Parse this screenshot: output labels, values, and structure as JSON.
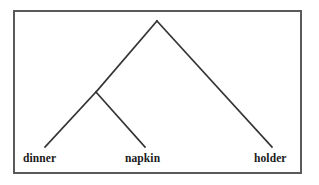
{
  "figure": {
    "kind": "syntax-tree",
    "bracketing": "[[dinner napkin] holder]",
    "border_color": "#5a5a5a",
    "line_color": "#333333",
    "background_color": "#ffffff",
    "text_color": "#1a1a1a"
  },
  "tree": {
    "root": {
      "name": "root-node",
      "x": 157,
      "y": 21
    },
    "internal": [
      {
        "name": "inner-node",
        "x": 96,
        "y": 92
      }
    ],
    "leaves": [
      {
        "name": "leaf-dinner",
        "label": "dinner",
        "x": 45,
        "y": 147
      },
      {
        "name": "leaf-napkin",
        "label": "napkin",
        "x": 145,
        "y": 147
      },
      {
        "name": "leaf-holder",
        "label": "holder",
        "x": 272,
        "y": 147
      }
    ],
    "branches": [
      {
        "name": "branch-root-to-inner",
        "x1": 157,
        "y1": 21,
        "x2": 96,
        "y2": 92
      },
      {
        "name": "branch-root-to-holder",
        "x1": 157,
        "y1": 21,
        "x2": 272,
        "y2": 147
      },
      {
        "name": "branch-inner-to-dinner",
        "x1": 96,
        "y1": 92,
        "x2": 45,
        "y2": 147
      },
      {
        "name": "branch-inner-to-napkin",
        "x1": 96,
        "y1": 92,
        "x2": 145,
        "y2": 147
      }
    ]
  },
  "labels": {
    "dinner": "dinner",
    "napkin": "napkin",
    "holder": "holder"
  }
}
